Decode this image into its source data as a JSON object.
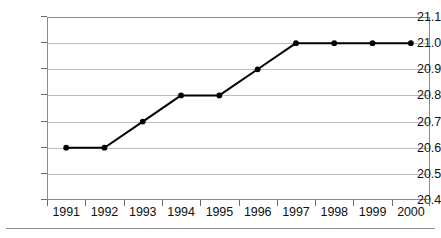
{
  "chart_data": {
    "type": "line",
    "title": "",
    "subtitle": "",
    "xlabel": "",
    "ylabel": "",
    "categories": [
      "1991",
      "1992",
      "1993",
      "1994",
      "1995",
      "1996",
      "1997",
      "1998",
      "1999",
      "2000"
    ],
    "x": [
      1991,
      1992,
      1993,
      1994,
      1995,
      1996,
      1997,
      1998,
      1999,
      2000
    ],
    "values": [
      20.6,
      20.6,
      20.7,
      20.8,
      20.8,
      20.9,
      21.0,
      21.0,
      21.0,
      21.0
    ],
    "series": [
      {
        "name": "",
        "values": [
          20.6,
          20.6,
          20.7,
          20.8,
          20.8,
          20.9,
          21.0,
          21.0,
          21.0,
          21.0
        ]
      }
    ],
    "ylim": [
      20.4,
      21.1
    ],
    "ytick_labels": [
      "21.1",
      "21.0",
      "20.9",
      "20.8",
      "20.7",
      "20.6",
      "20.5",
      "20.4"
    ],
    "ytick_values": [
      21.1,
      21.0,
      20.9,
      20.8,
      20.7,
      20.6,
      20.5,
      20.4
    ],
    "xtick_labels": [
      "1991",
      "1992",
      "1993",
      "1994",
      "1995",
      "1996",
      "1997",
      "1998",
      "1999",
      "2000"
    ],
    "grid": "horizontal",
    "legend": "none",
    "marker": "filled-circle",
    "line_color": "#000000",
    "grid_color": "#bdbdbd",
    "frame_color": "#8a8a8a",
    "background_color": "#ffffff",
    "annotations": []
  }
}
